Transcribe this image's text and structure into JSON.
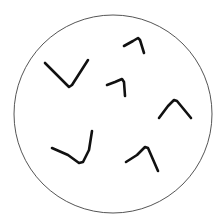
{
  "diagram": {
    "width": 222,
    "height": 224,
    "background": "#ffffff",
    "circle": {
      "cx": 113,
      "cy": 114,
      "r": 99,
      "stroke": "#555555",
      "stroke_width": 1
    },
    "stroke_color": "#111111",
    "stroke_width": 2.6,
    "strokes": [
      {
        "id": "stroke-1",
        "shape": "v",
        "points": [
          [
            45,
            63
          ],
          [
            57,
            75
          ],
          [
            69,
            87
          ],
          [
            72,
            85
          ],
          [
            88,
            60
          ]
        ]
      },
      {
        "id": "stroke-2",
        "shape": "hook",
        "points": [
          [
            124,
            46
          ],
          [
            133,
            41
          ],
          [
            138,
            38
          ],
          [
            140,
            40
          ],
          [
            144,
            53
          ]
        ]
      },
      {
        "id": "stroke-3",
        "shape": "hook",
        "points": [
          [
            107,
            85
          ],
          [
            115,
            82
          ],
          [
            122,
            79
          ],
          [
            124,
            82
          ],
          [
            125,
            96
          ]
        ]
      },
      {
        "id": "stroke-4",
        "shape": "caret",
        "points": [
          [
            159,
            118
          ],
          [
            168,
            106
          ],
          [
            174,
            100
          ],
          [
            177,
            101
          ],
          [
            191,
            118
          ]
        ]
      },
      {
        "id": "stroke-5",
        "shape": "check",
        "points": [
          [
            52,
            148
          ],
          [
            68,
            155
          ],
          [
            79,
            163
          ],
          [
            83,
            162
          ],
          [
            89,
            150
          ],
          [
            92,
            131
          ]
        ]
      },
      {
        "id": "stroke-6",
        "shape": "hook",
        "points": [
          [
            126,
            162
          ],
          [
            137,
            155
          ],
          [
            145,
            147
          ],
          [
            148,
            148
          ],
          [
            158,
            171
          ]
        ]
      }
    ]
  }
}
